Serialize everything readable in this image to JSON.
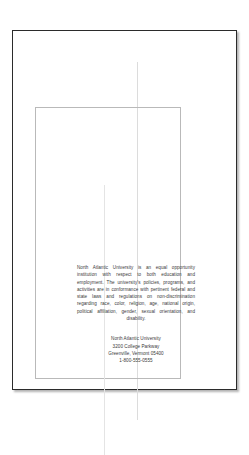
{
  "document": {
    "view": "page-layout-preview",
    "page_background": "#ffffff",
    "page_border_color": "#2b2b2b",
    "guide_color": "#b9b9b9",
    "text_color": "#3a3a3a"
  },
  "content": {
    "eeo_statement": "North Atlantic University is an equal opportunity institution with respect to both education and employment. The university's policies, programs, and activities are in conformance with pertinent federal and state laws and regulations on non-discrimination regarding race, color, religion, age, national origin, political affiliation, gender, sexual orientation, and disability.",
    "address": {
      "organization": "North Atlantic University",
      "street": "3200 College Parkway",
      "city_state_zip": "Greenville, Vermont 05400",
      "phone": "1-800-555-0555"
    }
  }
}
